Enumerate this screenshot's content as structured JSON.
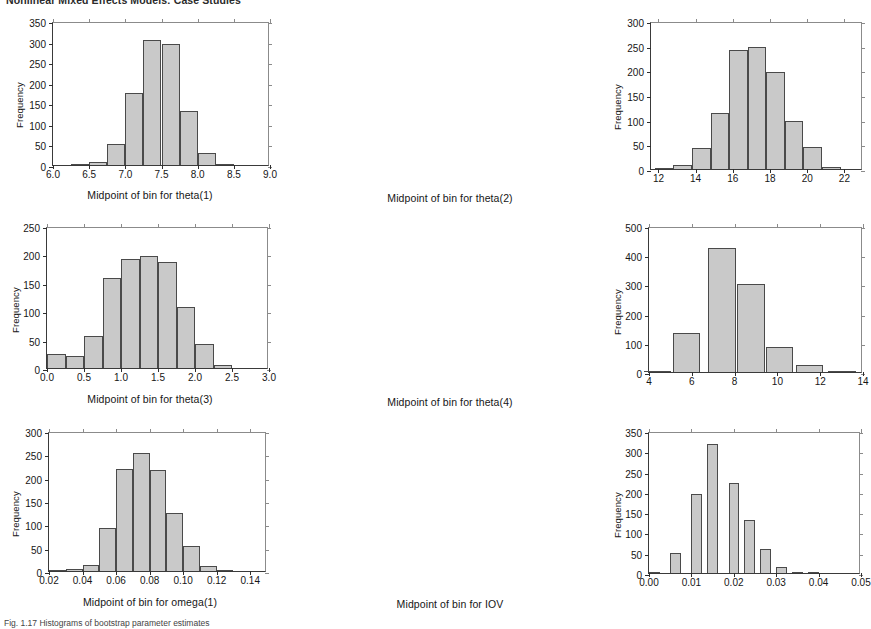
{
  "page": {
    "running_head": "Nonlinear Mixed Effects Models: Case Studies",
    "footer_note": "Fig. 1.17   Histograms of bootstrap parameter estimates"
  },
  "chart_data": [
    {
      "id": "theta1",
      "type": "bar",
      "title": "",
      "xlabel": "Midpoint of bin for theta(1)",
      "ylabel": "Frequency",
      "xlim": [
        6.0,
        9.0
      ],
      "ylim": [
        0,
        350
      ],
      "xticks": [
        "6.0",
        "6.5",
        "7.0",
        "7.5",
        "8.0",
        "8.5",
        "9.0"
      ],
      "xtickvals": [
        6.0,
        6.5,
        7.0,
        7.5,
        8.0,
        8.5,
        9.0
      ],
      "yticks": [
        "0",
        "50",
        "100",
        "150",
        "200",
        "250",
        "300",
        "350"
      ],
      "ytickvals": [
        0,
        50,
        100,
        150,
        200,
        250,
        300,
        350
      ],
      "bin_width": 0.25,
      "categories": [
        6.375,
        6.625,
        6.875,
        7.125,
        7.375,
        7.625,
        7.875,
        8.125,
        8.375
      ],
      "values": [
        2,
        8,
        51,
        175,
        303,
        295,
        132,
        29,
        3
      ],
      "grid": false,
      "legend": "none"
    },
    {
      "id": "theta2",
      "type": "bar",
      "title": "",
      "xlabel": "Midpoint of bin for theta(2)",
      "ylabel": "Frequency",
      "xlim": [
        11.6,
        23.0
      ],
      "ylim": [
        0,
        300
      ],
      "xticks": [
        "12",
        "14",
        "16",
        "18",
        "20",
        "22"
      ],
      "xtickvals": [
        12,
        14,
        16,
        18,
        20,
        22
      ],
      "yticks": [
        "0",
        "50",
        "100",
        "150",
        "200",
        "250",
        "300"
      ],
      "ytickvals": [
        0,
        50,
        100,
        150,
        200,
        250,
        300
      ],
      "bin_width": 1.0,
      "categories": [
        12.3,
        13.3,
        14.3,
        15.3,
        16.3,
        17.3,
        18.3,
        19.3,
        20.3,
        21.3
      ],
      "values": [
        2,
        9,
        43,
        114,
        241,
        248,
        197,
        97,
        44,
        5
      ],
      "grid": false,
      "legend": "none"
    },
    {
      "id": "theta3",
      "type": "bar",
      "title": "",
      "xlabel": "Midpoint of bin for theta(3)",
      "ylabel": "Frequency",
      "xlim": [
        0.0,
        3.0
      ],
      "ylim": [
        0,
        250
      ],
      "xticks": [
        "0.0",
        "0.5",
        "1.0",
        "1.5",
        "2.0",
        "2.5",
        "3.0"
      ],
      "xtickvals": [
        0.0,
        0.5,
        1.0,
        1.5,
        2.0,
        2.5,
        3.0
      ],
      "yticks": [
        "0",
        "50",
        "100",
        "150",
        "200",
        "250"
      ],
      "ytickvals": [
        0,
        50,
        100,
        150,
        200,
        250
      ],
      "bin_width": 0.25,
      "categories": [
        0.125,
        0.375,
        0.625,
        0.875,
        1.125,
        1.375,
        1.625,
        1.875,
        2.125,
        2.375,
        2.625
      ],
      "values": [
        25,
        22,
        57,
        159,
        192,
        197,
        186,
        107,
        43,
        6,
        0
      ],
      "grid": false,
      "legend": "none"
    },
    {
      "id": "theta4",
      "type": "bar",
      "title": "",
      "xlabel": "Midpoint of bin for theta(4)",
      "ylabel": "Frequency",
      "xlim": [
        4.0,
        14.0
      ],
      "ylim": [
        0,
        500
      ],
      "xticks": [
        "4",
        "6",
        "8",
        "10",
        "12",
        "14"
      ],
      "xtickvals": [
        4,
        6,
        8,
        10,
        12,
        14
      ],
      "bin_width": 1.3,
      "yticks": [
        "0",
        "100",
        "200",
        "300",
        "400",
        "500"
      ],
      "ytickvals": [
        0,
        100,
        200,
        300,
        400,
        500
      ],
      "categories": [
        4.4,
        5.75,
        7.4,
        8.75,
        10.1,
        11.5,
        13.0
      ],
      "values": [
        3,
        135,
        426,
        300,
        87,
        25,
        3
      ],
      "grid": false,
      "legend": "none"
    },
    {
      "id": "omega1",
      "type": "bar",
      "title": "",
      "xlabel": "Midpoint of bin for omega(1)",
      "ylabel": "Frequency",
      "xlim": [
        0.02,
        0.15
      ],
      "ylim": [
        0,
        300
      ],
      "xticks": [
        "0.02",
        "0.04",
        "0.06",
        "0.08",
        "0.10",
        "0.12",
        "0.14"
      ],
      "xtickvals": [
        0.02,
        0.04,
        0.06,
        0.08,
        0.1,
        0.12,
        0.14
      ],
      "yticks": [
        "0",
        "50",
        "100",
        "150",
        "200",
        "250",
        "300"
      ],
      "ytickvals": [
        0,
        50,
        100,
        150,
        200,
        250,
        300
      ],
      "bin_width": 0.01,
      "categories": [
        0.025,
        0.035,
        0.045,
        0.055,
        0.065,
        0.075,
        0.085,
        0.095,
        0.105,
        0.115,
        0.125
      ],
      "values": [
        1,
        4,
        13,
        93,
        218,
        252,
        217,
        125,
        54,
        11,
        2
      ],
      "grid": false,
      "legend": "none"
    },
    {
      "id": "iov",
      "type": "bar",
      "title": "",
      "xlabel": "Midpoint of bin for IOV",
      "ylabel": "Frequency",
      "xlim": [
        0.0,
        0.05
      ],
      "ylim": [
        0,
        350
      ],
      "xticks": [
        "0.00",
        "0.01",
        "0.02",
        "0.03",
        "0.04",
        "0.05"
      ],
      "xtickvals": [
        0.0,
        0.01,
        0.02,
        0.03,
        0.04,
        0.05
      ],
      "yticks": [
        "0",
        "50",
        "100",
        "150",
        "200",
        "250",
        "300",
        "350"
      ],
      "ytickvals": [
        0,
        50,
        100,
        150,
        200,
        250,
        300,
        350
      ],
      "bin_width": 0.0025,
      "categories": [
        0.00125,
        0.00625,
        0.01125,
        0.015,
        0.02,
        0.02375,
        0.0275,
        0.03125,
        0.035,
        0.03875
      ],
      "values": [
        2,
        49,
        195,
        317,
        223,
        131,
        59,
        15,
        2,
        2
      ],
      "grid": false,
      "legend": "none"
    }
  ]
}
